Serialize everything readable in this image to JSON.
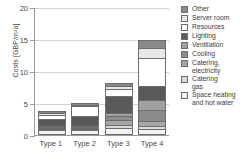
{
  "chart_data": {
    "type": "bar",
    "stacked": true,
    "title": "",
    "xlabel": "",
    "ylabel": "Costs [GBP/m²a]",
    "ylim": [
      0,
      20
    ],
    "yticks": [
      0,
      5,
      10,
      15,
      20
    ],
    "ytick_labels": [
      "0",
      "5",
      "10",
      "15",
      "20"
    ],
    "grid": "horizontal",
    "legend_position": "right",
    "categories": [
      "Type 1",
      "Type 2",
      "Type 3",
      "Type 4"
    ],
    "series": [
      {
        "name": "Space heating and hot water",
        "values": [
          0.45,
          0.5,
          0.75,
          0.65
        ],
        "color": "#f2f2f2"
      },
      {
        "name": "Catering gas",
        "values": [
          0.15,
          0.15,
          0.5,
          0.5
        ],
        "color": "#d9d9d9"
      },
      {
        "name": "Catering, electricity",
        "values": [
          0.2,
          0.2,
          0.85,
          0.8
        ],
        "color": "#a6a6a6"
      },
      {
        "name": "Cooling",
        "values": [
          0.1,
          0.1,
          0.55,
          1.7
        ],
        "color": "#8c8c8c"
      },
      {
        "name": "Ventilation",
        "values": [
          0.15,
          0.15,
          0.5,
          1.45
        ],
        "color": "#a0a0a0"
      },
      {
        "name": "Lighting",
        "values": [
          1.15,
          1.5,
          2.65,
          2.3
        ],
        "color": "#595959"
      },
      {
        "name": "Resources",
        "values": [
          0.6,
          1.55,
          1.05,
          4.4
        ],
        "color": "#ffffff"
      },
      {
        "name": "Server room",
        "values": [
          0.2,
          0.2,
          0.5,
          1.5
        ],
        "color": "#e8e8e8"
      },
      {
        "name": "Other",
        "values": [
          0.35,
          0.35,
          0.45,
          1.3
        ],
        "color": "#8a8a8a"
      }
    ],
    "totals": [
      3.35,
      4.7,
      7.8,
      14.6
    ],
    "legend_entries": [
      "Other",
      "Server room",
      "Resources",
      "Lighting",
      "Ventilation",
      "Cooling",
      "Catering,\nelectricity",
      "Catering\ngas",
      "Space heating\nand hot water"
    ],
    "legend_colors": [
      "#8a8a8a",
      "#e8e8e8",
      "#ffffff",
      "#595959",
      "#a0a0a0",
      "#8c8c8c",
      "#a6a6a6",
      "#d9d9d9",
      "#f2f2f2"
    ]
  }
}
